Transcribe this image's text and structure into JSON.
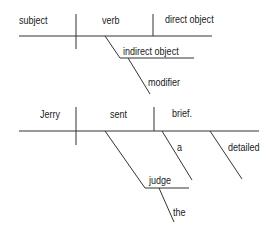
{
  "diagrams": [
    {
      "name": "template",
      "labels": {
        "subject": "subject",
        "verb": "verb",
        "direct_object": "direct object",
        "indirect_object": "indirect object",
        "modifier": "modifier"
      }
    },
    {
      "name": "example",
      "labels": {
        "subject": "Jerry",
        "verb": "sent",
        "direct_object": "brief.",
        "do_modifier_1": "a",
        "do_modifier_2": "detailed",
        "indirect_object": "judge",
        "io_modifier": "the"
      }
    }
  ],
  "colors": {
    "line": "#333333",
    "text": "#1a1a1a",
    "background": "#ffffff"
  }
}
